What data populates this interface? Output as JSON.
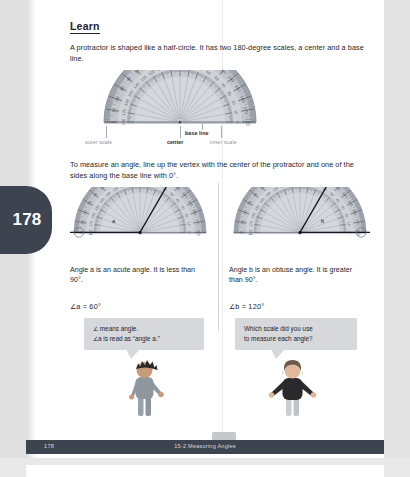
{
  "page": {
    "tab_number": "178",
    "footer_number": "178",
    "footer_title": "15-2  Measuring Angles"
  },
  "heading": "Learn",
  "intro_paragraph": "A protractor is shaped like a half-circle. It has two 180-degree scales, a center and a base line.",
  "figure1": {
    "labels": {
      "outer_scale": "outer scale",
      "center": "center",
      "inner_scale": "inner scale",
      "base_line": "base line"
    }
  },
  "instruction_paragraph": "To measure an angle, line up the vertex with the center of the protractor and one of the sides along the base line with 0°.",
  "figure2": {
    "left": {
      "angle_label": "a",
      "angle_degrees": 60
    },
    "right": {
      "angle_label": "b",
      "angle_degrees": 120
    }
  },
  "columns": {
    "left": {
      "description": "Angle a is an acute angle. It is less than 90°.",
      "equation": "∠a = 60°"
    },
    "right": {
      "description": "Angle b is an obtuse angle. It is greater than 90°.",
      "equation": "∠b = 120°"
    }
  },
  "callouts": {
    "left_line1": "∠ means angle.",
    "left_line2": "∠a is read as “angle a.”",
    "right_line1": "Which scale did you use",
    "right_line2": "to measure each angle?"
  },
  "protractor_ticks": {
    "major_labels_outer": [
      0,
      10,
      20,
      30,
      40,
      50,
      60,
      70,
      80,
      90,
      100,
      110,
      120,
      130,
      140,
      150,
      160,
      170,
      180
    ],
    "major_labels_inner": [
      180,
      170,
      160,
      150,
      140,
      130,
      120,
      110,
      100,
      90,
      80,
      70,
      60,
      50,
      40,
      30,
      20,
      10,
      0
    ]
  },
  "colors": {
    "page_tab": "#3d4450",
    "footer_bar": "#3d4450",
    "callout_bg": "#d6d8dc",
    "protractor_body": "#b9bdc4",
    "text": "#23292f",
    "muted_label": "#8d9097"
  }
}
